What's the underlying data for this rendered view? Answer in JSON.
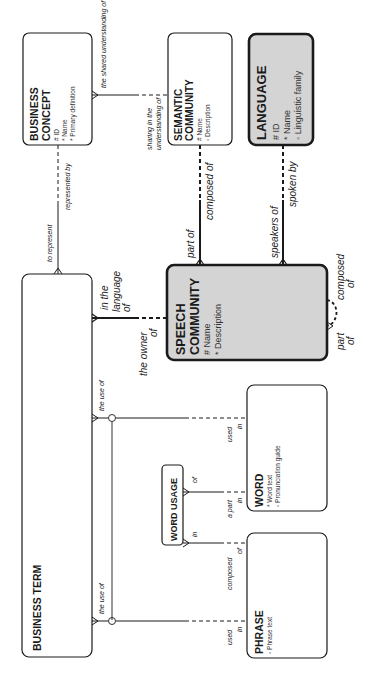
{
  "diagram": {
    "orientation": "rotated-90-ccw",
    "colors": {
      "line": "#1a1a1a",
      "highlight_fill": "#d4d4d4",
      "box_fill": "#ffffff"
    },
    "entities": {
      "business_concept": {
        "title_line1": "BUSINESS",
        "title_line2": "CONCEPT",
        "attributes": [
          "# ID",
          "* Name",
          "* Primary definition"
        ]
      },
      "semantic_community": {
        "title_line1": "SEMANTIC",
        "title_line2": "COMMUNITY",
        "attributes": [
          "# Name",
          "◦ Description"
        ]
      },
      "language": {
        "title": "LANGUAGE",
        "attributes": [
          "# ID",
          "* Name",
          "◦ Linguistic family"
        ]
      },
      "business_term": {
        "title": "BUSINESS TERM"
      },
      "speech_community": {
        "title_line1": "SPEECH",
        "title_line2": "COMMUNITY",
        "attributes": [
          "# Name",
          "* Description"
        ]
      },
      "word": {
        "title": "WORD",
        "attributes": [
          "* Word text",
          "◦ Pronunciation guide"
        ]
      },
      "word_usage": {
        "title": "WORD USAGE"
      },
      "phrase": {
        "title": "PHRASE",
        "attributes": [
          "◦ Phrase text"
        ]
      }
    },
    "relationships": {
      "concept_term": {
        "concept_end": "represented by",
        "term_end": "to represent"
      },
      "concept_semantic": {
        "concept_end": "the shared understanding of",
        "semantic_end_line1": "sharing in the",
        "semantic_end_line2": "understanding of"
      },
      "semantic_speech": {
        "semantic_end": "composed of",
        "speech_end": "part of"
      },
      "language_speech": {
        "language_end": "spoken by",
        "speech_end": "speakers of"
      },
      "term_speech": {
        "term_end_line1": "in the",
        "term_end_line2": "language",
        "term_end_line3": "of",
        "speech_end_line1": "the owner",
        "speech_end_line2": "of"
      },
      "speech_self": {
        "end1_line1": "composed",
        "end1_line2": "of",
        "end2_line1": "part",
        "end2_line2": "of"
      },
      "term_word": {
        "term_end": "the use of",
        "word_end_line1": "used",
        "word_end_line2": "in"
      },
      "term_phrase": {
        "term_end": "the use of",
        "phrase_end_line1": "used",
        "phrase_end_line2": "in"
      },
      "word_usage_word": {
        "usage_end": "of",
        "word_end_line1": "a part",
        "word_end_line2": "in"
      },
      "word_usage_phrase": {
        "usage_end": "in",
        "phrase_end_line1": "composed",
        "phrase_end_line2": "of"
      }
    }
  }
}
